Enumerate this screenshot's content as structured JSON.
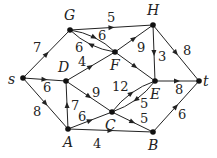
{
  "graph": {
    "nodes": [
      {
        "id": "s",
        "label": "s",
        "x": 23,
        "y": 78,
        "lx": 8,
        "ly": 84
      },
      {
        "id": "G",
        "label": "G",
        "x": 70,
        "y": 30,
        "lx": 64,
        "ly": 20
      },
      {
        "id": "H",
        "label": "H",
        "x": 153,
        "y": 25,
        "lx": 147,
        "ly": 15
      },
      {
        "id": "D",
        "label": "D",
        "x": 66,
        "y": 81,
        "lx": 58,
        "ly": 72
      },
      {
        "id": "F",
        "label": "F",
        "x": 115,
        "y": 52,
        "lx": 110,
        "ly": 70
      },
      {
        "id": "E",
        "label": "E",
        "x": 155,
        "y": 81,
        "lx": 150,
        "ly": 99
      },
      {
        "id": "t",
        "label": "t",
        "x": 199,
        "y": 81,
        "lx": 203,
        "ly": 86
      },
      {
        "id": "A",
        "label": "A",
        "x": 68,
        "y": 129,
        "lx": 63,
        "ly": 147
      },
      {
        "id": "C",
        "label": "C",
        "x": 112,
        "y": 112,
        "lx": 105,
        "ly": 130
      },
      {
        "id": "B",
        "label": "B",
        "x": 153,
        "y": 132,
        "lx": 148,
        "ly": 150
      }
    ],
    "edges": [
      {
        "from": "s",
        "to": "G",
        "w": "7",
        "lx": 33,
        "ly": 52
      },
      {
        "from": "s",
        "to": "D",
        "w": "6",
        "lx": 43,
        "ly": 92
      },
      {
        "from": "s",
        "to": "A",
        "w": "8",
        "lx": 33,
        "ly": 116
      },
      {
        "from": "G",
        "to": "H",
        "w": "5",
        "lx": 107,
        "ly": 22
      },
      {
        "from": "G",
        "to": "F",
        "w": "6",
        "curve": -8,
        "lx": 98,
        "ly": 40
      },
      {
        "from": "F",
        "to": "G",
        "w": "6",
        "curve": -8,
        "lx": 75,
        "ly": 52
      },
      {
        "from": "D",
        "to": "F",
        "w": "4",
        "lx": 78,
        "ly": 66
      },
      {
        "from": "F",
        "to": "H",
        "w": "9",
        "lx": 137,
        "ly": 52
      },
      {
        "from": "F",
        "to": "E",
        "w": "",
        "lx": 0,
        "ly": 0
      },
      {
        "from": "H",
        "to": "E",
        "w": "3",
        "lx": 158,
        "ly": 61
      },
      {
        "from": "H",
        "to": "t",
        "w": "8",
        "lx": 183,
        "ly": 55
      },
      {
        "from": "D",
        "to": "C",
        "w": "9",
        "lx": 92,
        "ly": 97
      },
      {
        "from": "A",
        "to": "D",
        "w": "7",
        "lx": 71,
        "ly": 110
      },
      {
        "from": "A",
        "to": "C",
        "w": "6",
        "lx": 78,
        "ly": 121
      },
      {
        "from": "A",
        "to": "B",
        "w": "4",
        "lx": 93,
        "ly": 148
      },
      {
        "from": "C",
        "to": "E",
        "w": "12",
        "curve": -8,
        "lx": 112,
        "ly": 91
      },
      {
        "from": "E",
        "to": "C",
        "w": "5",
        "curve": -8,
        "lx": 140,
        "ly": 108
      },
      {
        "from": "C",
        "to": "B",
        "w": "5",
        "lx": 140,
        "ly": 123
      },
      {
        "from": "E",
        "to": "t",
        "w": "8",
        "lx": 175,
        "ly": 94
      },
      {
        "from": "B",
        "to": "t",
        "w": "6",
        "lx": 178,
        "ly": 119
      }
    ]
  }
}
